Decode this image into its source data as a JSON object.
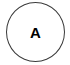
{
  "diagram": {
    "nodes": [
      {
        "id": "A",
        "label": "A",
        "shape": "circle",
        "stroke_color": "#3a3a3a",
        "fill_color": "#ffffff",
        "label_color": "#000000"
      }
    ]
  }
}
